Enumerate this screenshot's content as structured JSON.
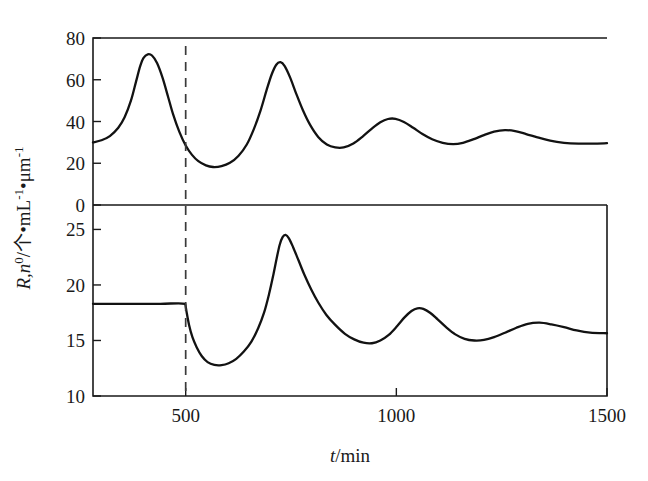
{
  "figure": {
    "background_color": "#ffffff",
    "curve_color": "#121212",
    "axis_color": "#1a1a1a",
    "event_line_color": "#3a3a3a"
  },
  "axis_titles": {
    "x_var": "t",
    "x_unit": "/min",
    "x_full": "t/min",
    "y_var": "R,n",
    "y_sup": "0",
    "y_unit": "/个•mL",
    "y_unit_sup1": "-1",
    "y_unit_mid": "•μm",
    "y_unit_sup2": "-1",
    "y_full": "R,n0/个•mL-1•μm-1"
  },
  "x_axis": {
    "tick_labels": [
      "500",
      "1000",
      "1500"
    ],
    "tick_values": [
      500,
      1000,
      1500
    ],
    "min": 280,
    "max": 1500
  },
  "upper_panel": {
    "y_tick_labels": [
      "0",
      "20",
      "40",
      "60",
      "80"
    ],
    "y_tick_values": [
      0,
      20,
      40,
      60,
      80
    ],
    "ymin": 0,
    "ymax": 80
  },
  "lower_panel": {
    "y_tick_labels": [
      "10",
      "15",
      "20",
      "25"
    ],
    "y_tick_values": [
      10,
      15,
      20,
      25
    ],
    "ymin": 10,
    "ymax": 27.2
  },
  "event_marker": {
    "t": 500,
    "style": "dashed",
    "label": ""
  },
  "chart_data": {
    "type": "line",
    "title": "",
    "xlabel": "t/min",
    "ylabel": "R,n0/个•mL-1•μm-1",
    "grid": false,
    "legend": "none",
    "panels": [
      {
        "name": "upper",
        "ylabel_ticks": [
          0,
          20,
          40,
          60,
          80
        ],
        "ylim": [
          0,
          80
        ],
        "xlim": [
          280,
          1500
        ],
        "series": [
          {
            "name": "R",
            "points": [
              [
                280,
                30.0
              ],
              [
                300,
                31.0
              ],
              [
                320,
                33.0
              ],
              [
                340,
                37.0
              ],
              [
                355,
                42.0
              ],
              [
                370,
                50.0
              ],
              [
                382,
                59.0
              ],
              [
                392,
                66.5
              ],
              [
                400,
                70.5
              ],
              [
                410,
                72.2
              ],
              [
                420,
                71.6
              ],
              [
                432,
                68.0
              ],
              [
                445,
                61.0
              ],
              [
                458,
                52.0
              ],
              [
                470,
                43.5
              ],
              [
                485,
                35.0
              ],
              [
                500,
                28.5
              ],
              [
                515,
                24.0
              ],
              [
                530,
                21.0
              ],
              [
                548,
                19.0
              ],
              [
                565,
                18.2
              ],
              [
                585,
                18.6
              ],
              [
                605,
                20.2
              ],
              [
                625,
                23.5
              ],
              [
                645,
                29.0
              ],
              [
                662,
                36.5
              ],
              [
                678,
                45.5
              ],
              [
                692,
                55.0
              ],
              [
                704,
                62.5
              ],
              [
                715,
                67.2
              ],
              [
                725,
                68.4
              ],
              [
                735,
                66.5
              ],
              [
                748,
                61.0
              ],
              [
                762,
                53.5
              ],
              [
                778,
                45.5
              ],
              [
                795,
                38.5
              ],
              [
                815,
                32.5
              ],
              [
                835,
                29.0
              ],
              [
                855,
                27.6
              ],
              [
                875,
                27.6
              ],
              [
                898,
                29.5
              ],
              [
                920,
                32.8
              ],
              [
                942,
                36.6
              ],
              [
                962,
                39.6
              ],
              [
                980,
                41.2
              ],
              [
                998,
                41.3
              ],
              [
                1018,
                39.8
              ],
              [
                1040,
                37.0
              ],
              [
                1062,
                34.0
              ],
              [
                1085,
                31.5
              ],
              [
                1110,
                29.8
              ],
              [
                1135,
                29.2
              ],
              [
                1158,
                29.8
              ],
              [
                1182,
                31.4
              ],
              [
                1208,
                33.5
              ],
              [
                1232,
                35.2
              ],
              [
                1258,
                35.9
              ],
              [
                1282,
                35.4
              ],
              [
                1308,
                34.0
              ],
              [
                1335,
                32.4
              ],
              [
                1365,
                30.8
              ],
              [
                1398,
                29.8
              ],
              [
                1432,
                29.4
              ],
              [
                1466,
                29.4
              ],
              [
                1500,
                29.6
              ]
            ]
          }
        ]
      },
      {
        "name": "lower",
        "ylabel_ticks": [
          10,
          15,
          20,
          25
        ],
        "ylim": [
          10,
          27.2
        ],
        "xlim": [
          280,
          1500
        ],
        "series": [
          {
            "name": "n0",
            "points": [
              [
                280,
                18.3
              ],
              [
                360,
                18.3
              ],
              [
                440,
                18.3
              ],
              [
                499,
                18.3
              ],
              [
                502,
                17.6
              ],
              [
                508,
                16.4
              ],
              [
                516,
                15.3
              ],
              [
                526,
                14.4
              ],
              [
                538,
                13.6
              ],
              [
                552,
                13.05
              ],
              [
                568,
                12.8
              ],
              [
                585,
                12.78
              ],
              [
                602,
                12.95
              ],
              [
                620,
                13.35
              ],
              [
                638,
                14.0
              ],
              [
                656,
                14.9
              ],
              [
                672,
                16.1
              ],
              [
                686,
                17.5
              ],
              [
                698,
                19.2
              ],
              [
                708,
                20.9
              ],
              [
                716,
                22.4
              ],
              [
                723,
                23.6
              ],
              [
                730,
                24.3
              ],
              [
                737,
                24.5
              ],
              [
                745,
                24.2
              ],
              [
                755,
                23.4
              ],
              [
                768,
                22.2
              ],
              [
                782,
                20.9
              ],
              [
                798,
                19.6
              ],
              [
                815,
                18.4
              ],
              [
                834,
                17.3
              ],
              [
                855,
                16.4
              ],
              [
                878,
                15.6
              ],
              [
                900,
                15.1
              ],
              [
                922,
                14.8
              ],
              [
                942,
                14.75
              ],
              [
                962,
                15.0
              ],
              [
                982,
                15.5
              ],
              [
                1002,
                16.3
              ],
              [
                1020,
                17.1
              ],
              [
                1036,
                17.65
              ],
              [
                1050,
                17.9
              ],
              [
                1064,
                17.85
              ],
              [
                1080,
                17.5
              ],
              [
                1098,
                16.9
              ],
              [
                1118,
                16.2
              ],
              [
                1140,
                15.55
              ],
              [
                1162,
                15.15
              ],
              [
                1185,
                15.0
              ],
              [
                1208,
                15.05
              ],
              [
                1232,
                15.3
              ],
              [
                1258,
                15.7
              ],
              [
                1285,
                16.15
              ],
              [
                1312,
                16.5
              ],
              [
                1340,
                16.6
              ],
              [
                1368,
                16.45
              ],
              [
                1398,
                16.2
              ],
              [
                1428,
                15.9
              ],
              [
                1460,
                15.7
              ],
              [
                1500,
                15.65
              ]
            ]
          }
        ]
      }
    ]
  }
}
